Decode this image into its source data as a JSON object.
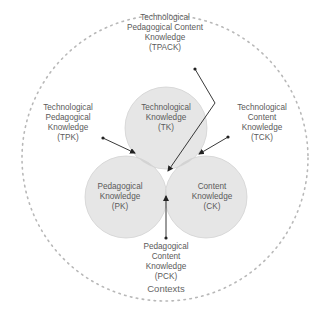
{
  "colors": {
    "outer_dashed": "#b8b8b8",
    "circle_fill": "#e6e6e6",
    "circle_stroke": "#d2d2d2",
    "pair_overlap": "#d0d0d0",
    "center_overlap": "#b9b9b9",
    "arrow": "#222222",
    "text": "#5a5a5a"
  },
  "circles": {
    "tk": {
      "lines": [
        "Technological",
        "Knowledge",
        "(TK)"
      ]
    },
    "pk": {
      "lines": [
        "Pedagogical",
        "Knowledge",
        "(PK)"
      ]
    },
    "ck": {
      "lines": [
        "Content",
        "Knowledge",
        "(CK)"
      ]
    }
  },
  "intersections": {
    "tpack": {
      "lines": [
        "Technological",
        "Pedagogical Content",
        "Knowledge",
        "(TPACK)"
      ]
    },
    "tpk": {
      "lines": [
        "Technological",
        "Pedagogical",
        "Knowledge",
        "(TPK)"
      ]
    },
    "tck": {
      "lines": [
        "Technological",
        "Content",
        "Knowledge",
        "(TCK)"
      ]
    },
    "pck": {
      "lines": [
        "Pedagogical",
        "Content",
        "Knowledge",
        "(PCK)"
      ]
    }
  },
  "contexts_label": "Contexts"
}
